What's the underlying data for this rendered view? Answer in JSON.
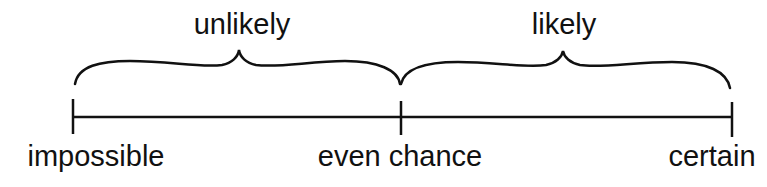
{
  "diagram": {
    "type": "probability-scale",
    "line_color": "#111111",
    "background": "#ffffff",
    "scale_points": [
      {
        "label": "impossible",
        "position": "left"
      },
      {
        "label": "even chance",
        "position": "middle"
      },
      {
        "label": "certain",
        "position": "right"
      }
    ],
    "ranges": [
      {
        "label": "unlikely",
        "from": "impossible",
        "to": "even chance"
      },
      {
        "label": "likely",
        "from": "even chance",
        "to": "certain"
      }
    ]
  }
}
